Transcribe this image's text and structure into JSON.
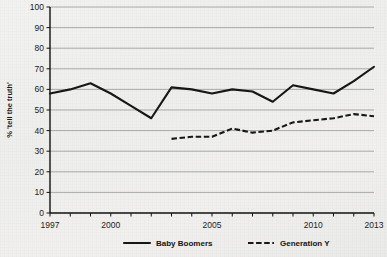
{
  "chart_data": {
    "type": "line",
    "title": "",
    "subtitle": "",
    "xlabel": "",
    "ylabel": "% 'tell the truth'",
    "xlim": [
      1997,
      2013
    ],
    "ylim": [
      0,
      100
    ],
    "ytick_step": 10,
    "yticks": [
      "0",
      "10",
      "20",
      "30",
      "40",
      "50",
      "60",
      "70",
      "80",
      "90",
      "100"
    ],
    "xticks_labeled": [
      "1997",
      "2000",
      "2005",
      "2010",
      "2013"
    ],
    "xticks_all": [
      1997,
      1998,
      1999,
      2000,
      2001,
      2002,
      2003,
      2004,
      2005,
      2006,
      2007,
      2008,
      2009,
      2010,
      2011,
      2012,
      2013
    ],
    "grid": "horizontal",
    "legend_position": "bottom",
    "series": [
      {
        "name": "Baby Boomers",
        "style": "solid",
        "color": "#171717",
        "x": [
          1997,
          1998,
          1999,
          2000,
          2001,
          2002,
          2003,
          2004,
          2005,
          2006,
          2007,
          2008,
          2009,
          2010,
          2011,
          2012,
          2013
        ],
        "values": [
          58,
          60,
          63,
          58,
          52,
          46,
          61,
          60,
          58,
          60,
          59,
          54,
          62,
          60,
          58,
          64,
          71
        ]
      },
      {
        "name": "Generation Y",
        "style": "dashed",
        "color": "#171717",
        "x": [
          2003,
          2004,
          2005,
          2006,
          2007,
          2008,
          2009,
          2010,
          2011,
          2012,
          2013
        ],
        "values": [
          36,
          37,
          37,
          41,
          39,
          40,
          44,
          45,
          46,
          48,
          47
        ]
      }
    ]
  },
  "legend": {
    "items": [
      {
        "label": "Baby Boomers",
        "style": "solid"
      },
      {
        "label": "Generation Y",
        "style": "dashed"
      }
    ]
  }
}
